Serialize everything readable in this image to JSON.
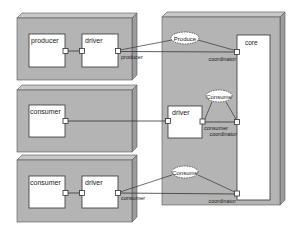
{
  "diagram": {
    "type": "UML deployment diagram",
    "colors": {
      "node_fill": "#b4b4b4",
      "node_top": "#c8c8c8",
      "node_side": "#9c9c9c",
      "component_fill": "#ffffff",
      "stroke": "#333333",
      "background": "#ffffff"
    },
    "nodes": [
      {
        "id": "node-producer",
        "components": [
          {
            "id": "producer",
            "label": "producer"
          },
          {
            "id": "driver",
            "label": "driver"
          }
        ],
        "port_labels": {
          "driver_out": "producer"
        }
      },
      {
        "id": "node-consumer-direct",
        "components": [
          {
            "id": "consumer",
            "label": "consumer"
          }
        ]
      },
      {
        "id": "node-consumer-driver",
        "components": [
          {
            "id": "consumer",
            "label": "consumer"
          },
          {
            "id": "driver",
            "label": "driver"
          }
        ],
        "port_labels": {
          "driver_out": "consumer"
        }
      },
      {
        "id": "node-core",
        "components": [
          {
            "id": "core",
            "label": "core"
          },
          {
            "id": "driver",
            "label": "driver"
          }
        ],
        "port_labels": {
          "coordinator_top": "coordinator",
          "driver_out_line1": "consumer",
          "driver_out_line2": "coordinator",
          "coordinator_bottom": "coordinator"
        }
      }
    ],
    "collaborations": [
      {
        "id": "produce",
        "label": "Produce"
      },
      {
        "id": "consume-middle",
        "label": "Consume"
      },
      {
        "id": "consume-bottom",
        "label": "Consume"
      }
    ]
  }
}
